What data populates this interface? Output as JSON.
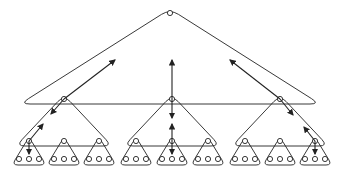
{
  "diagram": {
    "type": "hierarchical-triangle-tree",
    "levels": 4,
    "stroke_color": "#222222",
    "background": "#ffffff",
    "top": {
      "apex": [
        170,
        13
      ],
      "base_y": 104,
      "base_left": 20,
      "base_right": 320
    },
    "middle": [
      {
        "apex": [
          64,
          99
        ],
        "base_y": 146,
        "left": 16,
        "right": 112
      },
      {
        "apex": [
          172,
          99
        ],
        "base_y": 146,
        "left": 124,
        "right": 220
      },
      {
        "apex": [
          280,
          99
        ],
        "base_y": 146,
        "left": 232,
        "right": 328
      }
    ],
    "leaf_groups": [
      {
        "apex": [
          29,
          141
        ]
      },
      {
        "apex": [
          64,
          141
        ]
      },
      {
        "apex": [
          99,
          141
        ]
      },
      {
        "apex": [
          136,
          141
        ]
      },
      {
        "apex": [
          172,
          141
        ]
      },
      {
        "apex": [
          208,
          141
        ]
      },
      {
        "apex": [
          245,
          141
        ]
      },
      {
        "apex": [
          280,
          141
        ]
      },
      {
        "apex": [
          315,
          141
        ]
      }
    ],
    "leaves_per_group": 3,
    "arrows": [
      {
        "from": [
          64,
          99
        ],
        "to": [
          115,
          60
        ],
        "bidirectional": true,
        "toEnd": [
          51,
          114
        ]
      },
      {
        "from": [
          172,
          99
        ],
        "to": [
          172,
          60
        ],
        "bidirectional": true,
        "toEnd": [
          172,
          118
        ]
      },
      {
        "from": [
          280,
          99
        ],
        "to": [
          230,
          60
        ],
        "bidirectional": true,
        "toEnd": [
          293,
          115
        ]
      },
      {
        "from": [
          29,
          141
        ],
        "to": [
          43,
          124
        ],
        "bidirectional": true,
        "toEnd": [
          29,
          154
        ]
      },
      {
        "from": [
          172,
          141
        ],
        "to": [
          172,
          124
        ],
        "bidirectional": true,
        "toEnd": [
          172,
          154
        ]
      },
      {
        "from": [
          315,
          141
        ],
        "to": [
          304,
          127
        ],
        "bidirectional": true,
        "toEnd": [
          315,
          154
        ]
      }
    ]
  }
}
